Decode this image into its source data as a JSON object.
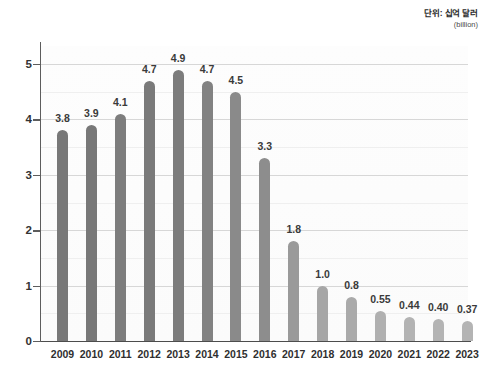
{
  "caption": {
    "unit_main": "단위: 십억 달러",
    "unit_sub": "(billion)"
  },
  "axis": {
    "y_ticks": [
      "0",
      "1",
      "2",
      "3",
      "4",
      "5"
    ]
  },
  "colors": {
    "bar_dark": "#7c7c7c",
    "bar_mid": "#8f8f8f",
    "bar_light": "#b0b0b0",
    "gridline": "#d7d7d7",
    "gridline_minor": "#efefef",
    "axis": "#4d4d4d",
    "text": "#333333",
    "plot_background": "#fcfcfc"
  },
  "chart_data": {
    "type": "bar",
    "title": "",
    "subtitle": "",
    "xlabel": "",
    "ylabel": "",
    "unit": "단위: 십억 달러 (billion)",
    "categories": [
      "2009",
      "2010",
      "2011",
      "2012",
      "2013",
      "2014",
      "2015",
      "2016",
      "2017",
      "2018",
      "2019",
      "2020",
      "2021",
      "2022",
      "2023"
    ],
    "values": [
      3.8,
      3.9,
      4.1,
      4.7,
      4.9,
      4.7,
      4.5,
      3.3,
      1.8,
      1.0,
      0.8,
      0.55,
      0.44,
      0.4,
      0.37
    ],
    "value_labels": [
      "3.8",
      "3.9",
      "4.1",
      "4.7",
      "4.9",
      "4.7",
      "4.5",
      "3.3",
      "1.8",
      "1.0",
      "0.8",
      "0.55",
      "0.44",
      "0.40",
      "0.37"
    ],
    "bar_colors": [
      "#787878",
      "#787878",
      "#7d7d7d",
      "#7a7a7a",
      "#7c7c7c",
      "#828282",
      "#8a8a8a",
      "#8d8d8d",
      "#9a9a9a",
      "#a6a6a6",
      "#aaaaaa",
      "#b0b0b0",
      "#b3b3b3",
      "#b4b4b4",
      "#b4b4b4"
    ],
    "ylim": [
      0,
      5.35
    ],
    "yticks": [
      0,
      1,
      2,
      3,
      4,
      5
    ],
    "minor_yticks": [
      0.5,
      1.5,
      2.5,
      3.5,
      4.5,
      5.0
    ],
    "grid": true,
    "legend": null
  }
}
